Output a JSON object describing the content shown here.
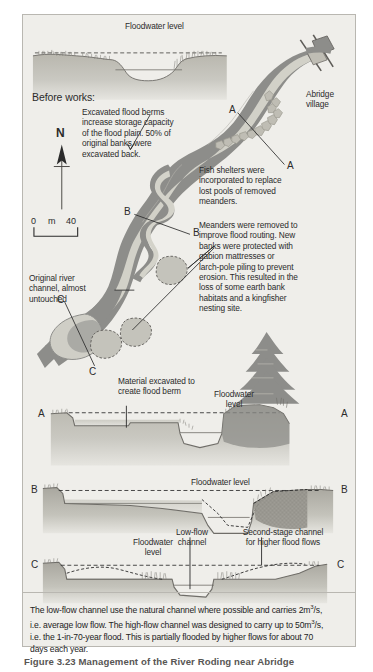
{
  "figure": {
    "bottom_caption": "Figure 3.23  Management of the River Roding near Abridge"
  },
  "colors": {
    "panel_bg": "#efeeea",
    "panel_border": "#b9b7b1",
    "river_dark": "#8d8d8a",
    "river_light": "#cfcec6",
    "ground_mid": "#b7b5ad",
    "ground_dark": "#9b9992",
    "ink": "#2b2b2b",
    "line": "#575551"
  },
  "top_section": {
    "floodwater_label": "Floodwater level",
    "heading": "Before works:"
  },
  "map": {
    "annotations": [
      {
        "id": "flood-berms",
        "text": "Excavated flood berms\nincrease storage capacity\nof the flood plain. 50% of\noriginal banks were\nexcavated back."
      },
      {
        "id": "fish-shelters",
        "text": "Fish shelters were\nincorporated to replace\nlost pools of removed\nmeanders."
      },
      {
        "id": "meanders-removed",
        "text": "Meanders were removed to\nimprove flood routing. New\nbanks were protected with\ngabion mattresses or\nlarch-pole piling to prevent\nerosion. This resulted in the\nloss of some earth bank\nhabitats and a kingfisher\nnesting site."
      },
      {
        "id": "original-channel",
        "text": "Original river\nchannel, almost\nuntouched"
      }
    ],
    "village_label": "Abridge\nvillage",
    "compass_label": "N",
    "scale": {
      "start": "0",
      "unit": "m",
      "end": "40"
    },
    "section_markers": {
      "a_left": "A",
      "a_right": "A",
      "b_left": "B",
      "b_right": "B",
      "c_left": "C",
      "c_right": "C"
    }
  },
  "cross_sections": [
    {
      "id": "section-a",
      "left_label": "A",
      "right_label": "A",
      "labels": [
        {
          "id": "berm-material",
          "text": "Material excavated to\ncreate flood berm"
        },
        {
          "id": "floodwater",
          "text": "Floodwater\nlevel"
        }
      ]
    },
    {
      "id": "section-b",
      "left_label": "B",
      "right_label": "B",
      "labels": [
        {
          "id": "floodwater",
          "text": "Floodwater level"
        }
      ]
    },
    {
      "id": "section-c",
      "left_label": "C",
      "right_label": "C",
      "labels": [
        {
          "id": "floodwater",
          "text": "Floodwater\nlevel"
        },
        {
          "id": "low-flow",
          "text": "Low-flow\nchannel"
        },
        {
          "id": "second-stage",
          "text": "Second-stage  channel\nfor higher flood flows"
        }
      ]
    }
  ],
  "caption": {
    "line1": "The low-flow channel use the natural channel where possible and carries 2m",
    "sup1": "3",
    "line1b": "/s,",
    "line2": "i.e. average low flow. The high-flow channel was designed to carry up to 50m",
    "sup2": "3",
    "line2b": "/s,",
    "line3": "i.e. the 1-in-70-year flood. This is partially flooded by higher flows for about 70",
    "line4": "days each year."
  }
}
